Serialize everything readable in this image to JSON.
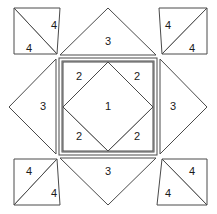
{
  "diagram": {
    "colors": {
      "stroke": "#4a4a4a",
      "fill": "#ffffff",
      "label": "#1a1a1a",
      "background": "#ffffff"
    },
    "geometry": {
      "canvas_width": 217,
      "canvas_height": 214,
      "block_left": 14,
      "block_top": 8,
      "block_right": 207,
      "block_bottom": 205,
      "inner_square_left": 59,
      "inner_square_top": 58,
      "inner_square_right": 157,
      "inner_square_bottom": 155,
      "inner_frame_inset": 3
    },
    "pieces": [
      {
        "id": "center-diamond",
        "label": "1",
        "shape": "diamond",
        "points": "108,62 153,107 108,151 63,107",
        "label_x": 108,
        "label_y": 107
      },
      {
        "id": "inner-corner-top-left",
        "label": "2",
        "shape": "triangle",
        "points": "63,62 108,62 63,107",
        "label_x": 79,
        "label_y": 77
      },
      {
        "id": "inner-corner-top-right",
        "label": "2",
        "shape": "triangle",
        "points": "153,62 153,107 108,62",
        "label_x": 137,
        "label_y": 77
      },
      {
        "id": "inner-corner-bottom-left",
        "label": "2",
        "shape": "triangle",
        "points": "63,151 63,107 108,151",
        "label_x": 79,
        "label_y": 137
      },
      {
        "id": "inner-corner-bottom-right",
        "label": "2",
        "shape": "triangle",
        "points": "153,151 108,151 153,107",
        "label_x": 137,
        "label_y": 137
      },
      {
        "id": "edge-triangle-top",
        "label": "3",
        "shape": "triangle",
        "points": "60,55 156,55 108,8",
        "label_x": 108,
        "label_y": 42
      },
      {
        "id": "edge-triangle-left",
        "label": "3",
        "shape": "triangle",
        "points": "56,59 56,154 9,107",
        "label_x": 43,
        "label_y": 107
      },
      {
        "id": "edge-triangle-right",
        "label": "3",
        "shape": "triangle",
        "points": "160,59 207,107 160,154",
        "label_x": 173,
        "label_y": 107
      },
      {
        "id": "edge-triangle-bottom",
        "label": "3",
        "shape": "triangle",
        "points": "60,158 156,158 108,205",
        "label_x": 108,
        "label_y": 172
      },
      {
        "id": "corner-top-left-upper",
        "label": "4",
        "shape": "triangle",
        "points": "14,8 60,8 57,54",
        "label_x": 54,
        "label_y": 26
      },
      {
        "id": "corner-top-left-lower",
        "label": "4",
        "shape": "triangle",
        "points": "14,8 57,54 14,54",
        "label_x": 29,
        "label_y": 49
      },
      {
        "id": "corner-top-right-upper",
        "label": "4",
        "shape": "triangle",
        "points": "159,8 207,8 162,54",
        "label_x": 168,
        "label_y": 26
      },
      {
        "id": "corner-top-right-lower",
        "label": "4",
        "shape": "triangle",
        "points": "207,8 207,54 162,54",
        "label_x": 192,
        "label_y": 49
      },
      {
        "id": "corner-bottom-left-upper",
        "label": "4",
        "shape": "triangle",
        "points": "14,159 57,159 14,205",
        "label_x": 29,
        "label_y": 172
      },
      {
        "id": "corner-bottom-left-lower",
        "label": "4",
        "shape": "triangle",
        "points": "14,205 57,159 60,205",
        "label_x": 54,
        "label_y": 194
      },
      {
        "id": "corner-bottom-right-upper",
        "label": "4",
        "shape": "triangle",
        "points": "162,159 207,159 207,205",
        "label_x": 192,
        "label_y": 172
      },
      {
        "id": "corner-bottom-right-lower",
        "label": "4",
        "shape": "triangle",
        "points": "157,205 162,159 207,205",
        "label_x": 168,
        "label_y": 194
      }
    ]
  }
}
